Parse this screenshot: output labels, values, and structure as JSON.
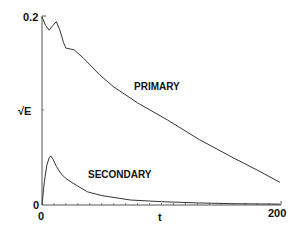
{
  "chart_data": {
    "type": "line",
    "title": "",
    "xlabel": "t",
    "ylabel": "√E",
    "xlim": [
      0,
      200
    ],
    "ylim": [
      0,
      0.2
    ],
    "x_tick_labels": [
      "0",
      "200"
    ],
    "y_tick_labels": [
      "0",
      "0.2"
    ],
    "grid": false,
    "legend": "none (curves annotated inline)",
    "annotations": [
      "PRIMARY",
      "SECONDARY"
    ],
    "series": [
      {
        "name": "PRIMARY",
        "x": [
          0,
          3,
          6,
          9,
          12,
          15,
          18,
          20,
          24,
          27,
          35,
          48,
          60,
          80,
          105,
          132,
          160,
          180,
          199
        ],
        "y": [
          0.199,
          0.19,
          0.185,
          0.19,
          0.194,
          0.185,
          0.172,
          0.166,
          0.165,
          0.164,
          0.155,
          0.138,
          0.125,
          0.108,
          0.09,
          0.069,
          0.05,
          0.037,
          0.024
        ]
      },
      {
        "name": "SECONDARY",
        "x": [
          0,
          2,
          4,
          6,
          7.3,
          9,
          12,
          16,
          20,
          26,
          30,
          38,
          50,
          74,
          100,
          130,
          160,
          199
        ],
        "y": [
          0.0,
          0.025,
          0.042,
          0.05,
          0.052,
          0.049,
          0.041,
          0.033,
          0.028,
          0.023,
          0.02,
          0.014,
          0.01,
          0.0053,
          0.0035,
          0.0022,
          0.0014,
          0.001
        ]
      }
    ]
  },
  "labels": {
    "y_zero": "0",
    "y_top": "0.2",
    "x_zero": "0",
    "x_end": "200",
    "x_axis": "t",
    "y_axis": "√E",
    "primary": "PRIMARY",
    "secondary": "SECONDARY"
  },
  "style": {
    "line_color": "#333333",
    "axis_color": "#555555"
  }
}
